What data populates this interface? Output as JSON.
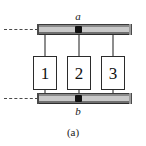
{
  "figure": {
    "caption": "(a)",
    "terminals": [
      {
        "id": "a",
        "label": "a",
        "position": "top"
      },
      {
        "id": "b",
        "label": "b",
        "position": "bottom"
      }
    ],
    "busbars": [
      {
        "id": "top-busbar",
        "name": "top conductor rail"
      },
      {
        "id": "bottom-busbar",
        "name": "bottom conductor rail"
      }
    ],
    "leads": [
      {
        "id": "top-lead",
        "style": "dashed",
        "name": "top dashed continuation"
      },
      {
        "id": "bottom-lead",
        "style": "dashed",
        "name": "bottom dashed continuation"
      }
    ],
    "components": [
      {
        "id": "component-1",
        "label": "1",
        "x": 33
      },
      {
        "id": "component-2",
        "label": "2",
        "x": 67
      },
      {
        "id": "component-3",
        "label": "3",
        "x": 101
      }
    ],
    "colors": {
      "background": "#ffffff",
      "bar_face": "#c9c9c9",
      "bar_top": "#8a8a8a",
      "bar_bottom": "#6f6f6f",
      "wire": "#8d8d8d",
      "box_border": "#2b2b2b",
      "node": "#111111",
      "text": "#1a1a1a"
    }
  }
}
